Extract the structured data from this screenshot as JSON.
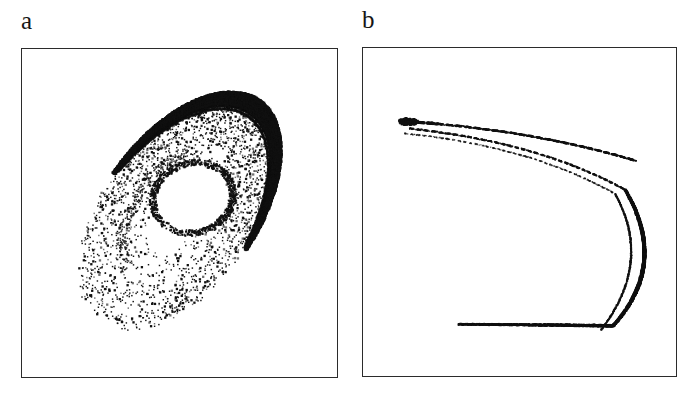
{
  "figure": {
    "width": 698,
    "height": 396,
    "background_color": "#ffffff",
    "ink_color": "#111111",
    "frame_color": "#2b2b2b",
    "panel_count": 2
  },
  "panels": [
    {
      "id": "a",
      "label": "a",
      "frame": {
        "x": 21,
        "y": 48,
        "width": 317,
        "height": 330
      },
      "description": "Scatter of points forming a tilted elliptical annulus (chaotic attractor cross-section / Poincare section) with a white elliptical hole near the centre and a dense dark outer rim on the upper-right side."
    },
    {
      "id": "b",
      "label": "b",
      "frame": {
        "x": 362,
        "y": 47,
        "width": 315,
        "height": 330
      },
      "description": "Thin parabola-like C-shaped curve opening to the left, made of two to three nearly parallel strands that converge at a cusp at the upper left and fold back at the right."
    }
  ],
  "chart_data": [
    {
      "panel": "a",
      "type": "scatter",
      "title": "",
      "xlabel": "",
      "ylabel": "",
      "grid": false,
      "legend": null,
      "axis_ticks": false,
      "xlim": [
        0,
        1
      ],
      "ylim": [
        0,
        1
      ],
      "marker": {
        "shape": "point",
        "size_px": 1.4,
        "color": "#111111"
      },
      "point_count_approx": 9000,
      "structure": {
        "shape": "elliptical-annulus",
        "outer_ellipse": {
          "cx": 0.5,
          "cy": 0.5,
          "rx": 0.44,
          "ry": 0.235,
          "rotation_deg": -54
        },
        "hole_ellipse": {
          "cx": 0.545,
          "cy": 0.455,
          "rx": 0.115,
          "ry": 0.095,
          "rotation_deg": -18
        },
        "dense_rim": {
          "side": "upper-right-to-lower-right",
          "angle_range_deg": [
            -120,
            95
          ],
          "thickness": 0.045,
          "color": "#000000"
        },
        "density_profile": "dense along the outer rim on the NE and SE edges, moderate speckle through the body, sparse and ragged on the SW/left boundary"
      }
    },
    {
      "panel": "b",
      "type": "scatter",
      "title": "",
      "xlabel": "",
      "ylabel": "",
      "grid": false,
      "legend": null,
      "axis_ticks": false,
      "xlim": [
        0,
        1
      ],
      "ylim": [
        0,
        1
      ],
      "marker": {
        "shape": "point",
        "size_px": 1.1,
        "color": "#111111"
      },
      "point_count_approx": 2600,
      "structure": {
        "shape": "parabolic-C-curve-opening-left",
        "cusp": {
          "x": 0.145,
          "y": 0.225
        },
        "fold_apex": {
          "x": 0.885,
          "y": 0.66
        },
        "upper_branch_end": {
          "x": 0.875,
          "y": 0.345
        },
        "lower_branch_end": {
          "x": 0.305,
          "y": 0.845
        },
        "strands": [
          {
            "name": "upper-outer",
            "offset": 0.0
          },
          {
            "name": "upper-inner",
            "offset": 0.035
          },
          {
            "name": "lower",
            "offset": 0.07
          }
        ],
        "density_profile": "solid and dark near the right fold and the lower branch, dashed and faint along the upper strands"
      }
    }
  ]
}
